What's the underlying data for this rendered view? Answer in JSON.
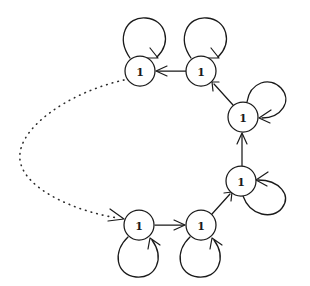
{
  "figure": {
    "background_color": "#ffffff",
    "stroke_color": "#1a1a1a",
    "dotted_stroke_color": "#2b2b2b",
    "width": 310,
    "height": 286
  },
  "nodes": [
    {
      "id": "n1",
      "label": "1",
      "cx": 140,
      "cy": 71,
      "r": 15,
      "name": "node-top-left"
    },
    {
      "id": "n2",
      "label": "1",
      "cx": 201,
      "cy": 71,
      "r": 15,
      "name": "node-top-right"
    },
    {
      "id": "n3",
      "label": "1",
      "cx": 243,
      "cy": 117,
      "r": 15,
      "name": "node-right-upper"
    },
    {
      "id": "n4",
      "label": "1",
      "cx": 241,
      "cy": 181,
      "r": 15,
      "name": "node-right-lower"
    },
    {
      "id": "n5",
      "label": "1",
      "cx": 201,
      "cy": 225,
      "r": 15,
      "name": "node-bottom-right"
    },
    {
      "id": "n6",
      "label": "1",
      "cx": 139,
      "cy": 225,
      "r": 15,
      "name": "node-bottom-left"
    }
  ],
  "edges": [
    {
      "from": "n2",
      "to": "n1",
      "style": "solid",
      "name": "edge-top-right-to-top-left"
    },
    {
      "from": "n3",
      "to": "n2",
      "style": "solid",
      "name": "edge-right-upper-to-top-right"
    },
    {
      "from": "n4",
      "to": "n3",
      "style": "solid",
      "name": "edge-right-lower-to-right-upper"
    },
    {
      "from": "n5",
      "to": "n4",
      "style": "solid",
      "name": "edge-bottom-right-to-right-lower"
    },
    {
      "from": "n6",
      "to": "n5",
      "style": "solid",
      "name": "edge-bottom-left-to-bottom-right"
    },
    {
      "from": "n1",
      "to": "n6",
      "style": "dotted",
      "name": "edge-top-left-to-bottom-left-dotted"
    }
  ],
  "self_loops": [
    {
      "node": "n1",
      "direction": "up",
      "name": "self-loop-top-left"
    },
    {
      "node": "n2",
      "direction": "up",
      "name": "self-loop-top-right"
    },
    {
      "node": "n3",
      "direction": "upper-right",
      "name": "self-loop-right-upper"
    },
    {
      "node": "n4",
      "direction": "lower-right",
      "name": "self-loop-right-lower"
    },
    {
      "node": "n5",
      "direction": "down",
      "name": "self-loop-bottom-right"
    },
    {
      "node": "n6",
      "direction": "down",
      "name": "self-loop-bottom-left"
    }
  ],
  "labels": {
    "n1": "1",
    "n2": "1",
    "n3": "1",
    "n4": "1",
    "n5": "1",
    "n6": "1"
  }
}
